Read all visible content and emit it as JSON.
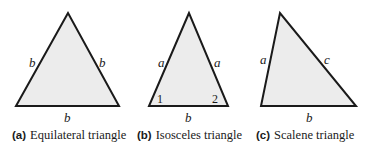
{
  "figures": [
    {
      "tag": "(a)",
      "caption": "Equilateral triangle",
      "labels": {
        "left": "b",
        "right": "b",
        "base": "b"
      }
    },
    {
      "tag": "(b)",
      "caption": "Isosceles triangle",
      "labels": {
        "left": "a",
        "right": "a",
        "base": "b",
        "angle1": "1",
        "angle2": "2"
      }
    },
    {
      "tag": "(c)",
      "caption": "Scalene triangle",
      "labels": {
        "left": "a",
        "right": "c",
        "base": "b"
      }
    }
  ],
  "colors": {
    "fill": "#ececec",
    "stroke": "#1a1a1a"
  }
}
